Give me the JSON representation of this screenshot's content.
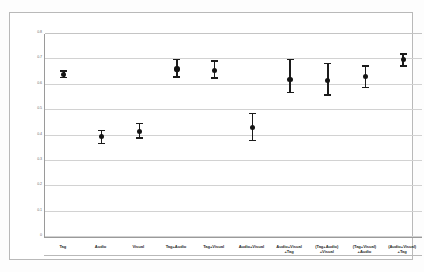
{
  "chart_data": {
    "type": "scatter",
    "title": "",
    "subtitle": "",
    "xlabel": "",
    "ylabel": "",
    "ylim": [
      0,
      0.8
    ],
    "ytick_labels": [
      "0.8",
      "0.7",
      "0.6",
      "0.5",
      "0.4",
      "0.3",
      "0.2",
      "0.1",
      "0"
    ],
    "ytick_values": [
      0.8,
      0.7,
      0.6,
      0.5,
      0.4,
      0.3,
      0.2,
      0.1,
      0
    ],
    "grid": true,
    "legend": "none",
    "error_bar_style": "capped-vertical",
    "marker": "filled-circle",
    "marker_color": "#141414",
    "categories": [
      "Tag",
      "Audio",
      "Visual",
      "Tag+Audio",
      "Tag+Visual",
      "Audio+Visual",
      "Audio+Visual\n+Tag",
      "(Tag+Audio)\n+Visual",
      "(Tag+Visual)\n+Audio",
      "(Audio+Visual)\n+Tag"
    ],
    "values": [
      0.641,
      0.396,
      0.415,
      0.662,
      0.657,
      0.432,
      0.622,
      0.618,
      0.634,
      0.698
    ],
    "err_low": [
      0.628,
      0.368,
      0.39,
      0.63,
      0.626,
      0.38,
      0.57,
      0.56,
      0.589,
      0.675
    ],
    "err_high": [
      0.655,
      0.42,
      0.447,
      0.7,
      0.694,
      0.487,
      0.699,
      0.684,
      0.675,
      0.721
    ],
    "series": [
      {
        "name": "Accuracy",
        "points": [
          {
            "category": "Tag",
            "value": 0.641,
            "low": 0.628,
            "high": 0.655
          },
          {
            "category": "Audio",
            "value": 0.396,
            "low": 0.368,
            "high": 0.42
          },
          {
            "category": "Visual",
            "value": 0.415,
            "low": 0.39,
            "high": 0.447
          },
          {
            "category": "Tag+Audio",
            "value": 0.662,
            "low": 0.63,
            "high": 0.7
          },
          {
            "category": "Tag+Visual",
            "value": 0.657,
            "low": 0.626,
            "high": 0.694
          },
          {
            "category": "Audio+Visual",
            "value": 0.432,
            "low": 0.38,
            "high": 0.487
          },
          {
            "category": "Audio+Visual +Tag",
            "value": 0.622,
            "low": 0.57,
            "high": 0.699
          },
          {
            "category": "(Tag+Audio) +Visual",
            "value": 0.618,
            "low": 0.56,
            "high": 0.684
          },
          {
            "category": "(Tag+Visual) +Audio",
            "value": 0.634,
            "low": 0.589,
            "high": 0.675
          },
          {
            "category": "(Audio+Visual) +Tag",
            "value": 0.698,
            "low": 0.675,
            "high": 0.721
          }
        ]
      }
    ]
  }
}
